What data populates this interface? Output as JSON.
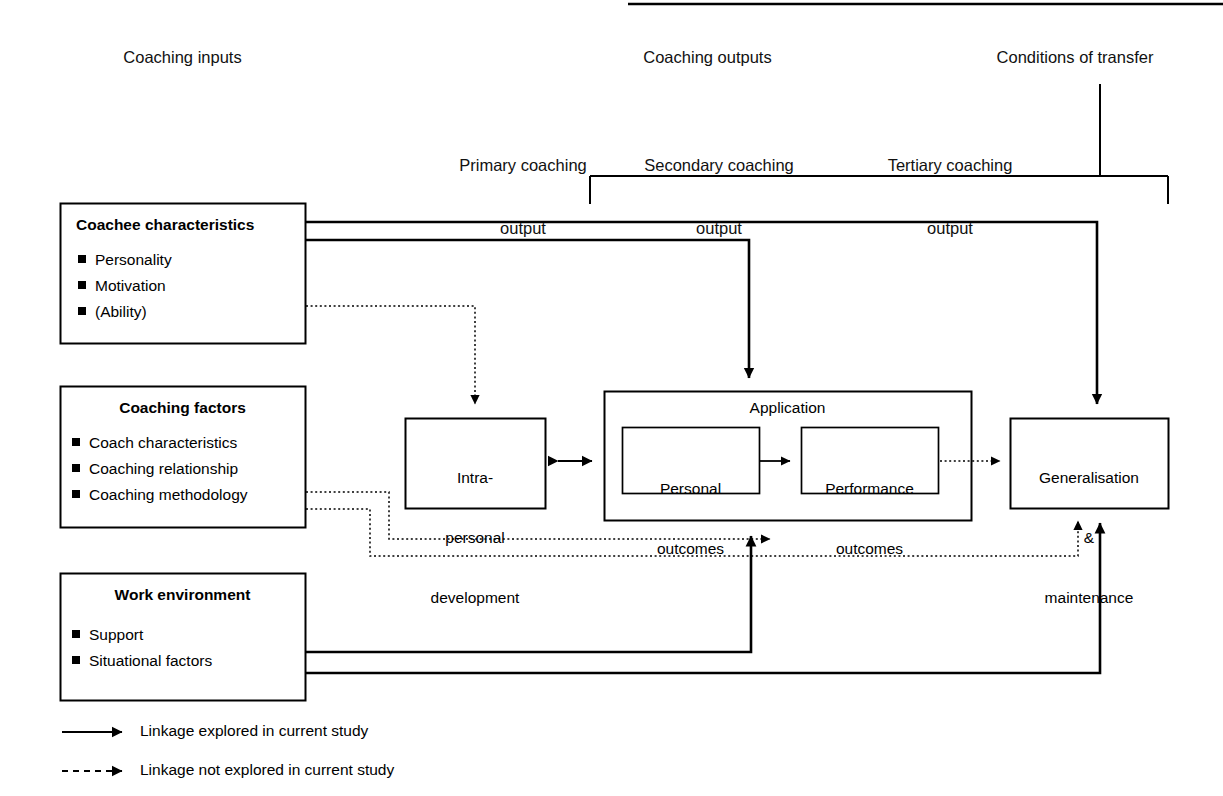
{
  "figure": {
    "type": "flow-diagram",
    "title_absent": true,
    "column_headers": [
      {
        "id": "coaching-inputs",
        "label": "Coaching inputs"
      },
      {
        "id": "coaching-outputs",
        "label": "Coaching outputs"
      },
      {
        "id": "conditions-of-transfer",
        "label": "Conditions of transfer"
      }
    ],
    "sub_headers": [
      {
        "id": "primary",
        "line1": "Primary coaching",
        "line2": "output"
      },
      {
        "id": "secondary",
        "line1": "Secondary coaching",
        "line2": "output"
      },
      {
        "id": "tertiary",
        "line1": "Tertiary coaching",
        "line2": "output"
      }
    ],
    "input_boxes": [
      {
        "id": "coachee-characteristics",
        "title": "Coachee characteristics",
        "title_align": "left",
        "items": [
          "Personality",
          "Motivation",
          "(Ability)"
        ]
      },
      {
        "id": "coaching-factors",
        "title": "Coaching factors",
        "title_align": "center",
        "items": [
          "Coach characteristics",
          "Coaching relationship",
          "Coaching methodology"
        ]
      },
      {
        "id": "work-environment",
        "title": "Work environment",
        "title_align": "center",
        "items": [
          "Support",
          "Situational factors"
        ]
      }
    ],
    "process_boxes": [
      {
        "id": "intra-personal-development",
        "line1": "Intra-",
        "line2": "personal",
        "line3": "development"
      },
      {
        "id": "application",
        "label": "Application"
      },
      {
        "id": "personal-outcomes",
        "line1": "Personal",
        "line2": "outcomes"
      },
      {
        "id": "performance-outcomes",
        "line1": "Performance",
        "line2": "outcomes"
      },
      {
        "id": "generalisation-maintenance",
        "line1": "Generalisation",
        "line2": "&",
        "line3": "maintenance"
      }
    ],
    "legend": [
      {
        "id": "explored",
        "style": "solid",
        "label": "Linkage explored in current study"
      },
      {
        "id": "not-explored",
        "style": "dashed",
        "label": "Linkage not explored in current study"
      }
    ],
    "colors": {
      "stroke": "#000000",
      "background": "#ffffff",
      "text": "#111111"
    }
  }
}
